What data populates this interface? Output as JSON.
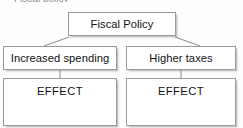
{
  "diagram": {
    "type": "flowchart",
    "clipped_caption": "Fiscal policy",
    "nodes": {
      "root": {
        "label": "Fiscal Policy"
      },
      "branch_left": {
        "label": "Increased spending"
      },
      "branch_right": {
        "label": "Higher taxes"
      },
      "effect_left": {
        "label": "EFFECT"
      },
      "effect_right": {
        "label": "EFFECT"
      }
    },
    "colors": {
      "box_border": "#9a9a9a",
      "box_fill": "#ffffff",
      "connector": "#8a8a8a",
      "text": "#121212",
      "background": "#fdfdfd"
    }
  }
}
